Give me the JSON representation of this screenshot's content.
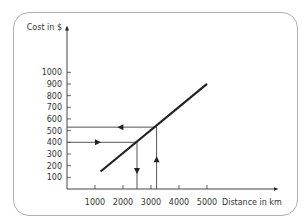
{
  "chart_data": {
    "type": "line",
    "title": "",
    "xlabel": "Distance in km",
    "ylabel": "Cost in $",
    "xlim": [
      0,
      5500
    ],
    "ylim": [
      0,
      1100
    ],
    "x_ticks": [
      1000,
      2000,
      3000,
      4000,
      5000
    ],
    "x_tick_labels": [
      "1000",
      "2000",
      "3000",
      "4000",
      "5000"
    ],
    "y_ticks": [
      100,
      200,
      300,
      400,
      500,
      600,
      700,
      800,
      900,
      1000
    ],
    "y_tick_labels": [
      "100",
      "200",
      "300",
      "400",
      "500",
      "600",
      "700",
      "800",
      "900",
      "1000"
    ],
    "grid": false,
    "legend": null,
    "series": [
      {
        "name": "Cost vs distance",
        "x": [
          1200,
          5000
        ],
        "y": [
          150,
          900
        ]
      }
    ],
    "annotations": [
      {
        "type": "arrow-path",
        "description": "From cost 400 on the y-axis, right to the line, then down to distance ~2500",
        "points": [
          [
            0,
            400
          ],
          [
            2500,
            400
          ],
          [
            2500,
            0
          ]
        ]
      },
      {
        "type": "arrow-path",
        "description": "From distance ~3200 on the x-axis, up to the line, then left to cost ~530",
        "points": [
          [
            3200,
            0
          ],
          [
            3200,
            530
          ],
          [
            0,
            530
          ]
        ]
      }
    ]
  },
  "axes": {
    "x_label": "Distance in km",
    "y_label": "Cost in $"
  }
}
